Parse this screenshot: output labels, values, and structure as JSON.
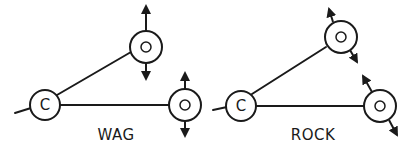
{
  "diagram": {
    "type": "molecular-vibration-modes",
    "panels": [
      {
        "mode_label": "WAG",
        "center_atom": "C",
        "outer_atoms": [
          "O",
          "O"
        ],
        "motion": "both O atoms move perpendicular to the plane, in opposite directions (up/down arrows)"
      },
      {
        "mode_label": "ROCK",
        "center_atom": "C",
        "outer_atoms": [
          "O",
          "O"
        ],
        "motion": "both O atoms move tangentially in the plane (diagonal arrows)"
      }
    ],
    "colors": {
      "stroke": "#1a1a1a",
      "background": "#ffffff"
    }
  }
}
